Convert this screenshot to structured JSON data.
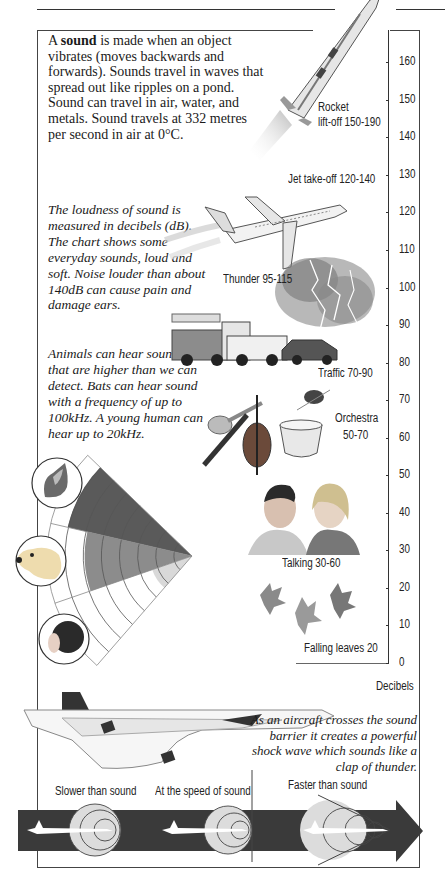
{
  "intro": {
    "prefix": "A ",
    "bold": "sound",
    "text": " is made when an object vibrates (moves backwards and forwards). Sounds travel in waves that spread out like ripples on a pond. Sound can travel in air, water, and metals. Sound travels at 332 metres per second in air at 0°C."
  },
  "loudness_note": "The loudness of sound is measured in decibels (dB). The chart shows some everyday sounds, loud and soft. Noise louder than about 140dB can cause pain and damage ears.",
  "hearing_note": "Animals can hear sounds that are higher than we can detect. Bats can hear sound with a frequency of up to 100kHz. A young human can hear up to 20kHz.",
  "sound_barrier_note": "As an aircraft crosses the sound barrier it creates a powerful shock wave which sounds like a clap of thunder.",
  "chart_data": [
    {
      "type": "table",
      "title": "Loudness of everyday sounds",
      "ylabel": "Decibels",
      "ylim": [
        0,
        160
      ],
      "y_ticks": [
        0,
        10,
        20,
        30,
        40,
        50,
        60,
        70,
        80,
        90,
        100,
        110,
        120,
        130,
        140,
        150,
        160
      ],
      "items": [
        {
          "name": "Rocket lift-off",
          "label_line1": "Rocket",
          "label_line2": "lift-off 150-190",
          "min_db": 150,
          "max_db": 190
        },
        {
          "name": "Jet take-off",
          "label": "Jet take-off 120-140",
          "min_db": 120,
          "max_db": 140
        },
        {
          "name": "Thunder",
          "label": "Thunder 95-115",
          "min_db": 95,
          "max_db": 115
        },
        {
          "name": "Traffic",
          "label": "Traffic 70-90",
          "min_db": 70,
          "max_db": 90
        },
        {
          "name": "Orchestra",
          "label_line1": "Orchestra",
          "label_line2": "50-70",
          "min_db": 50,
          "max_db": 70
        },
        {
          "name": "Talking",
          "label": "Talking 30-60",
          "min_db": 30,
          "max_db": 60
        },
        {
          "name": "Falling leaves",
          "label": "Falling leaves 20",
          "min_db": 20,
          "max_db": 20
        }
      ]
    },
    {
      "type": "pie",
      "title": "Hearing range comparison (fan diagram)",
      "series": [
        {
          "name": "Cat",
          "fill_fraction": 0.88,
          "color": "#5a5a5a"
        },
        {
          "name": "Dog",
          "fill_fraction": 0.74,
          "color": "#8c8c8c"
        },
        {
          "name": "Human",
          "fill_fraction": 0.29,
          "color": "#d9d9d9"
        }
      ],
      "rings": 8
    },
    {
      "type": "diagram",
      "title": "Sound barrier",
      "stages": [
        "Slower than sound",
        "At the speed of sound",
        "Faster than sound"
      ]
    }
  ],
  "stages": {
    "slower": "Slower than sound",
    "at_speed": "At the speed of sound",
    "faster": "Faster than sound"
  },
  "axis": {
    "label": "Decibels"
  },
  "colors": {
    "arrow": "#3a3a3a",
    "wave_fill": "#dcdcdc",
    "cat": "#5a5a5a",
    "dog": "#8c8c8c",
    "human": "#d9d9d9"
  }
}
